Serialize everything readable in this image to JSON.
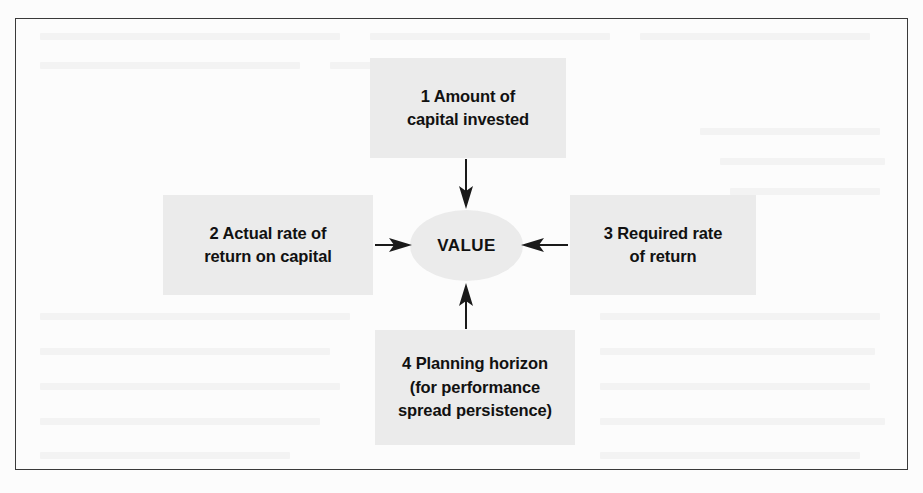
{
  "figure": {
    "kind": "value-driver-diagram",
    "center_node": {
      "label": "VALUE",
      "shape": "ellipse"
    },
    "nodes": [
      {
        "id": "1",
        "position": "top",
        "label": "1 Amount of\ncapital invested",
        "arrow": "down"
      },
      {
        "id": "2",
        "position": "left",
        "label": "2 Actual rate of\nreturn on capital",
        "arrow": "right"
      },
      {
        "id": "3",
        "position": "right",
        "label": "3 Required rate\nof return",
        "arrow": "left"
      },
      {
        "id": "4",
        "position": "bottom",
        "label": "4 Planning horizon\n(for performance\nspread persistence)",
        "arrow": "up"
      }
    ],
    "colors": {
      "node_fill": "#ebebeb",
      "node_text": "#111111",
      "arrow": "#1a1a1a",
      "frame_border": "#3a3a3a",
      "page_background": "#fcfcfc"
    }
  }
}
